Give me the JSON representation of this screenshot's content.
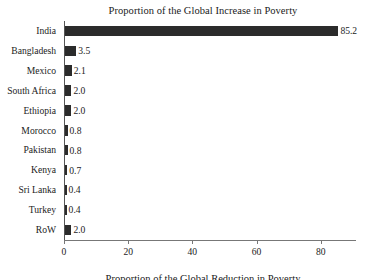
{
  "chart_data": {
    "type": "bar",
    "orientation": "horizontal",
    "title": "Proportion of the Global Increase in Poverty",
    "bottom_caption": "Proportion of the Global Reduction in Poverty",
    "xlabel": "",
    "ylabel": "",
    "xlim": [
      0,
      91
    ],
    "grid": false,
    "legend": null,
    "bar_color": "#2b2b2b",
    "axis_color": "#777777",
    "background": "#ffffff",
    "xticks": [
      0,
      20,
      40,
      60,
      80
    ],
    "xtick_labels": [
      "0",
      "20",
      "40",
      "60",
      "80"
    ],
    "categories": [
      "India",
      "Bangladesh",
      "Mexico",
      "South Africa",
      "Ethiopia",
      "Morocco",
      "Pakistan",
      "Kenya",
      "Sri Lanka",
      "Turkey",
      "RoW"
    ],
    "values": [
      85.2,
      3.5,
      2.1,
      2.0,
      2.0,
      0.8,
      0.8,
      0.7,
      0.4,
      0.4,
      2.0
    ],
    "value_labels": [
      "85.2",
      "3.5",
      "2.1",
      "2.0",
      "2.0",
      "0.8",
      "0.8",
      "0.7",
      "0.4",
      "0.4",
      "2.0"
    ]
  }
}
